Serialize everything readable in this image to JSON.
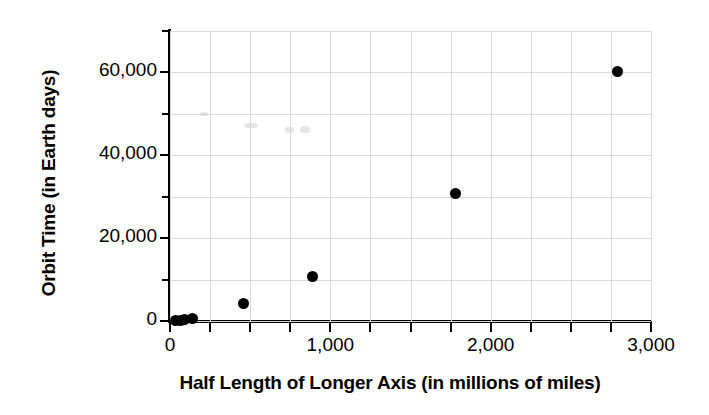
{
  "chart_data": {
    "type": "scatter",
    "title": "",
    "xlabel": "Half Length of Longer Axis (in millions of miles)",
    "ylabel": "Orbit Time (in Earth days)",
    "xlim": [
      0,
      3000
    ],
    "ylim": [
      0,
      70000
    ],
    "grid": true,
    "legend": null,
    "x_ticks": [
      0,
      1000,
      2000,
      3000
    ],
    "x_tick_labels": [
      "0",
      "1,000",
      "2,000",
      "3,000"
    ],
    "x_minor_tick_interval": 250,
    "y_ticks": [
      0,
      20000,
      40000,
      60000
    ],
    "y_tick_labels": [
      "0",
      "20,000",
      "40,000",
      "60,000"
    ],
    "y_minor_tick_interval": 10000,
    "marker": "filled-circle",
    "marker_color": "#000000",
    "grid_color": "#d9d9d9",
    "points": [
      {
        "x": 36,
        "y": 88
      },
      {
        "x": 67,
        "y": 225
      },
      {
        "x": 93,
        "y": 365
      },
      {
        "x": 142,
        "y": 687
      },
      {
        "x": 460,
        "y": 4330
      },
      {
        "x": 890,
        "y": 10750
      },
      {
        "x": 1780,
        "y": 30690
      },
      {
        "x": 2790,
        "y": 60190
      }
    ]
  },
  "axes": {
    "x_title": "Half Length of Longer Axis (in millions of miles)",
    "y_title": "Orbit Time (in Earth days)"
  }
}
